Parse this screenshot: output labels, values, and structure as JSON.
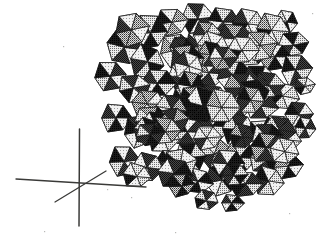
{
  "figure": {
    "background_color": "#ffffff",
    "width": 328,
    "height": 243,
    "rendering": "halftone dithered grayscale line drawing"
  },
  "axes_indicator": {
    "name": "three-axis orientation cross",
    "origin": {
      "x": 79,
      "y": 183
    },
    "stroke_color": "#3a3a38",
    "labels": [],
    "lines": [
      {
        "name": "vertical-axis",
        "x1": 79.5,
        "y1": 129,
        "x2": 79.0,
        "y2": 226,
        "width": 1.5
      },
      {
        "name": "horizontal-axis",
        "x1": 16,
        "y1": 179,
        "x2": 146,
        "y2": 187,
        "width": 1.3
      },
      {
        "name": "diagonal-axis",
        "x1": 55,
        "y1": 202,
        "x2": 106,
        "y2": 171,
        "width": 1.3
      }
    ]
  },
  "cluster": {
    "name": "octahedra-cluster",
    "shape_type": "octahedron",
    "bounds": {
      "x_min": 103,
      "y_min": 12,
      "x_max": 312,
      "y_max": 207
    },
    "face_tones": {
      "highlight": "#d9d9d9",
      "light": "#bdbdbd",
      "mid": "#9a9a9a",
      "dark": "#5d5d5d",
      "shadow": "#232323"
    },
    "edge_color": "#141414",
    "count_visible": 96,
    "octahedra": [
      {
        "cx": 124,
        "cy": 46,
        "r": 19,
        "t": [
          0,
          3,
          1,
          4
        ]
      },
      {
        "cx": 150,
        "cy": 32,
        "r": 18,
        "t": [
          1,
          4,
          0,
          3
        ]
      },
      {
        "cx": 147,
        "cy": 62,
        "r": 18,
        "t": [
          4,
          1,
          3,
          0
        ]
      },
      {
        "cx": 172,
        "cy": 22,
        "r": 17,
        "t": [
          0,
          2,
          1,
          4
        ]
      },
      {
        "cx": 176,
        "cy": 50,
        "r": 18,
        "t": [
          1,
          3,
          0,
          2
        ]
      },
      {
        "cx": 197,
        "cy": 18,
        "r": 17,
        "t": [
          3,
          0,
          4,
          1
        ]
      },
      {
        "cx": 201,
        "cy": 45,
        "r": 18,
        "t": [
          0,
          4,
          1,
          3
        ]
      },
      {
        "cx": 223,
        "cy": 21,
        "r": 17,
        "t": [
          1,
          3,
          0,
          4
        ]
      },
      {
        "cx": 227,
        "cy": 48,
        "r": 17,
        "t": [
          4,
          0,
          3,
          1
        ]
      },
      {
        "cx": 248,
        "cy": 24,
        "r": 17,
        "t": [
          0,
          1,
          4,
          3
        ]
      },
      {
        "cx": 251,
        "cy": 51,
        "r": 17,
        "t": [
          3,
          1,
          0,
          4
        ]
      },
      {
        "cx": 272,
        "cy": 30,
        "r": 17,
        "t": [
          1,
          0,
          4,
          2
        ]
      },
      {
        "cx": 275,
        "cy": 57,
        "r": 17,
        "t": [
          0,
          4,
          2,
          1
        ]
      },
      {
        "cx": 293,
        "cy": 44,
        "r": 16,
        "t": [
          4,
          1,
          3,
          0
        ]
      },
      {
        "cx": 296,
        "cy": 70,
        "r": 16,
        "t": [
          1,
          3,
          0,
          4
        ]
      },
      {
        "cx": 110,
        "cy": 76,
        "r": 17,
        "t": [
          0,
          3,
          1,
          4
        ]
      },
      {
        "cx": 134,
        "cy": 88,
        "r": 17,
        "t": [
          3,
          0,
          4,
          1
        ]
      },
      {
        "cx": 158,
        "cy": 83,
        "r": 18,
        "t": [
          1,
          4,
          0,
          3
        ]
      },
      {
        "cx": 160,
        "cy": 110,
        "r": 18,
        "t": [
          0,
          2,
          4,
          1
        ]
      },
      {
        "cx": 184,
        "cy": 76,
        "r": 18,
        "t": [
          4,
          1,
          3,
          0
        ]
      },
      {
        "cx": 186,
        "cy": 104,
        "r": 18,
        "t": [
          1,
          0,
          3,
          4
        ]
      },
      {
        "cx": 209,
        "cy": 72,
        "r": 18,
        "t": [
          0,
          3,
          1,
          2
        ]
      },
      {
        "cx": 211,
        "cy": 99,
        "r": 18,
        "t": [
          3,
          1,
          4,
          0
        ]
      },
      {
        "cx": 234,
        "cy": 76,
        "r": 18,
        "t": [
          1,
          4,
          0,
          3
        ]
      },
      {
        "cx": 236,
        "cy": 103,
        "r": 18,
        "t": [
          0,
          3,
          2,
          1
        ]
      },
      {
        "cx": 259,
        "cy": 79,
        "r": 17,
        "t": [
          4,
          0,
          1,
          3
        ]
      },
      {
        "cx": 261,
        "cy": 106,
        "r": 17,
        "t": [
          1,
          3,
          0,
          4
        ]
      },
      {
        "cx": 283,
        "cy": 96,
        "r": 17,
        "t": [
          0,
          1,
          4,
          3
        ]
      },
      {
        "cx": 299,
        "cy": 114,
        "r": 15,
        "t": [
          3,
          0,
          1,
          4
        ]
      },
      {
        "cx": 116,
        "cy": 118,
        "r": 16,
        "t": [
          0,
          4,
          1,
          3
        ]
      },
      {
        "cx": 139,
        "cy": 131,
        "r": 16,
        "t": [
          3,
          1,
          0,
          4
        ]
      },
      {
        "cx": 163,
        "cy": 137,
        "r": 17,
        "t": [
          1,
          0,
          4,
          2
        ]
      },
      {
        "cx": 188,
        "cy": 131,
        "r": 18,
        "t": [
          0,
          3,
          1,
          4
        ]
      },
      {
        "cx": 190,
        "cy": 158,
        "r": 17,
        "t": [
          4,
          1,
          3,
          0
        ]
      },
      {
        "cx": 213,
        "cy": 126,
        "r": 18,
        "t": [
          1,
          4,
          0,
          3
        ]
      },
      {
        "cx": 215,
        "cy": 153,
        "r": 18,
        "t": [
          0,
          2,
          3,
          1
        ]
      },
      {
        "cx": 238,
        "cy": 130,
        "r": 18,
        "t": [
          3,
          0,
          4,
          1
        ]
      },
      {
        "cx": 240,
        "cy": 157,
        "r": 18,
        "t": [
          1,
          4,
          0,
          2
        ]
      },
      {
        "cx": 263,
        "cy": 133,
        "r": 17,
        "t": [
          0,
          1,
          3,
          4
        ]
      },
      {
        "cx": 265,
        "cy": 160,
        "r": 17,
        "t": [
          4,
          3,
          1,
          0
        ]
      },
      {
        "cx": 286,
        "cy": 140,
        "r": 16,
        "t": [
          1,
          0,
          4,
          3
        ]
      },
      {
        "cx": 288,
        "cy": 166,
        "r": 15,
        "t": [
          0,
          4,
          1,
          2
        ]
      },
      {
        "cx": 124,
        "cy": 161,
        "r": 16,
        "t": [
          0,
          3,
          1,
          4
        ]
      },
      {
        "cx": 147,
        "cy": 167,
        "r": 16,
        "t": [
          3,
          1,
          4,
          0
        ]
      },
      {
        "cx": 170,
        "cy": 161,
        "r": 15,
        "t": [
          1,
          0,
          3,
          4
        ]
      },
      {
        "cx": 197,
        "cy": 181,
        "r": 16,
        "t": [
          0,
          4,
          1,
          3
        ]
      },
      {
        "cx": 221,
        "cy": 180,
        "r": 17,
        "t": [
          4,
          1,
          0,
          3
        ]
      },
      {
        "cx": 245,
        "cy": 184,
        "r": 17,
        "t": [
          1,
          3,
          4,
          0
        ]
      },
      {
        "cx": 268,
        "cy": 181,
        "r": 16,
        "t": [
          0,
          1,
          3,
          4
        ]
      },
      {
        "cx": 206,
        "cy": 200,
        "r": 13,
        "t": [
          3,
          0,
          4,
          1
        ]
      },
      {
        "cx": 232,
        "cy": 203,
        "r": 12,
        "t": [
          1,
          4,
          0,
          3
        ]
      },
      {
        "cx": 305,
        "cy": 128,
        "r": 11,
        "t": [
          0,
          3,
          1,
          4
        ]
      },
      {
        "cx": 304,
        "cy": 86,
        "r": 11,
        "t": [
          1,
          0,
          4,
          3
        ]
      },
      {
        "cx": 286,
        "cy": 22,
        "r": 12,
        "t": [
          0,
          4,
          3,
          1
        ]
      }
    ]
  },
  "scan_artifacts": {
    "name": "scan-speckle",
    "color": "#b9b9b7",
    "points": [
      {
        "x": 312,
        "y": 13
      },
      {
        "x": 131,
        "y": 197
      },
      {
        "x": 107,
        "y": 189
      },
      {
        "x": 63,
        "y": 46
      },
      {
        "x": 289,
        "y": 213
      },
      {
        "x": 175,
        "y": 232
      },
      {
        "x": 44,
        "y": 231
      }
    ]
  }
}
